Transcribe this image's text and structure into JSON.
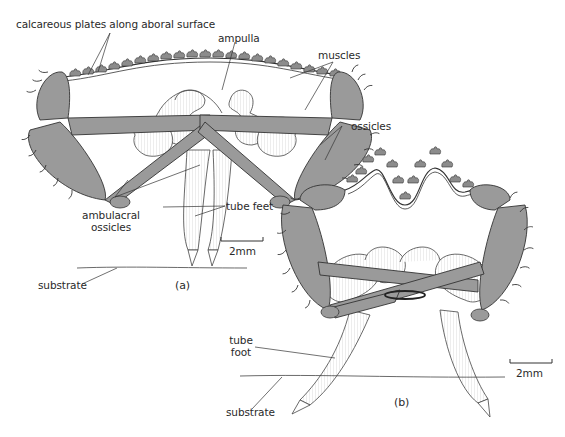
{
  "figure": {
    "panels": [
      {
        "id": "a",
        "label": "(a)"
      },
      {
        "id": "b",
        "label": "(b)"
      }
    ],
    "labels": {
      "calcareous_plates": "calcareous plates along aboral surface",
      "ampulla": "ampulla",
      "muscles": "muscles",
      "ossicles": "ossicles",
      "ambulacral_ossicles_line1": "ambulacral",
      "ambulacral_ossicles_line2": "ossicles",
      "tube_feet": "tube feet",
      "substrate_a": "substrate",
      "substrate_b": "substrate",
      "tube_foot_line1": "tube",
      "tube_foot_line2": "foot"
    },
    "scale_bars": [
      {
        "panel": "a",
        "label": "2mm"
      },
      {
        "panel": "b",
        "label": "2mm"
      }
    ],
    "colors": {
      "ink": "#2a2a2a",
      "muscle_fill": "#9a9a9a",
      "plate_fill": "#8c8c8c",
      "background": "#ffffff"
    }
  }
}
